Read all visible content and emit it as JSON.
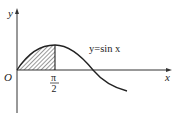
{
  "diagram": {
    "type": "function-graph",
    "function_label": "y=sin x",
    "axes": {
      "x_label": "x",
      "y_label": "y",
      "origin_label": "O"
    },
    "tick_labels": [
      {
        "value": "π/2",
        "numerator": "π",
        "denominator": "2"
      }
    ],
    "shaded_region": {
      "description": "area under y=sin x from 0 to π/2",
      "from": "0",
      "to": "π/2",
      "pattern": "diagonal hatching"
    },
    "colors": {
      "stroke": "#222222",
      "background": "#ffffff"
    }
  }
}
